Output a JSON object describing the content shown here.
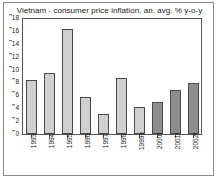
{
  "chart_data": {
    "type": "bar",
    "title": "Vietnam - consumer price inflation, an. avg. % y-o-y",
    "xlabel": "",
    "ylabel": "",
    "ylim": [
      0,
      18
    ],
    "yticks": [
      18,
      16,
      14,
      12,
      10,
      8,
      6,
      4,
      2,
      0
    ],
    "grid": false,
    "legend": "none",
    "categories": [
      "1993",
      "1994",
      "1995",
      "1996",
      "1997",
      "1998",
      "1999e",
      "2000f",
      "2001f",
      "2002f"
    ],
    "values": [
      8.4,
      9.5,
      16.3,
      5.8,
      3.1,
      8.7,
      4.2,
      5.0,
      6.9,
      7.9
    ],
    "series": [
      {
        "name": "consumer price inflation",
        "values": [
          8.4,
          9.5,
          16.3,
          5.8,
          3.1,
          8.7,
          4.2,
          5.0,
          6.9,
          7.9
        ],
        "point_styles": [
          "light",
          "light",
          "light",
          "light",
          "light",
          "light",
          "light",
          "dark",
          "dark",
          "dark"
        ]
      }
    ],
    "colors": {
      "bar_actual": "#d0d0d0",
      "bar_forecast": "#8d8d8d",
      "bar_outline": "#4a4a4a",
      "axis": "#555555",
      "frame": "#8a8a8a",
      "text": "#1a1a1a",
      "background": "#ffffff"
    }
  }
}
